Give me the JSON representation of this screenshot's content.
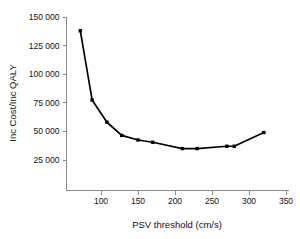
{
  "chart_data": {
    "type": "line",
    "title": "",
    "xlabel": "PSV threshold (cm/s)",
    "ylabel": "Inc Cost/Inc QALY",
    "xlim": [
      65,
      355
    ],
    "ylim": [
      0,
      150000
    ],
    "xticks": [
      100,
      150,
      200,
      250,
      300,
      350
    ],
    "xtick_labels": [
      "100",
      "150",
      "200",
      "250",
      "300",
      "350"
    ],
    "yticks": [
      25000,
      50000,
      75000,
      100000,
      125000,
      150000
    ],
    "ytick_labels": [
      "25 000",
      "50 000",
      "75 000",
      "100 000",
      "125 000",
      "150 000"
    ],
    "grid": false,
    "legend": false,
    "series": [
      {
        "name": "Inc Cost/Inc QALY",
        "color": "#000000",
        "marker": "square",
        "x": [
          72,
          88,
          108,
          128,
          150,
          170,
          210,
          230,
          270,
          280,
          320
        ],
        "y": [
          138000,
          77500,
          58000,
          46500,
          42500,
          40500,
          35000,
          35000,
          37000,
          37000,
          49000
        ]
      }
    ]
  },
  "axis": {
    "x_title": "PSV threshold (cm/s)",
    "y_title": "Inc Cost/Inc QALY"
  }
}
